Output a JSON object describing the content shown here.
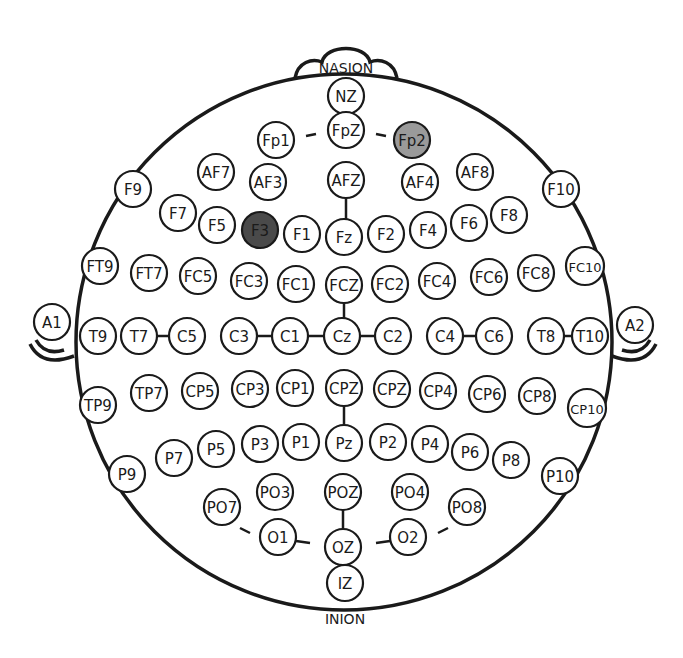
{
  "diagram": {
    "landmarks": {
      "top": "NASION",
      "bottom": "INION"
    },
    "colors": {
      "highlight_dark": "#4a4a4a",
      "highlight_light": "#9a9a9a",
      "stroke": "#1a1a1a",
      "fill": "#ffffff"
    },
    "electrodes": [
      {
        "id": "NZ",
        "x": 346,
        "y": 96,
        "fill": "#ffffff"
      },
      {
        "id": "FpZ",
        "x": 346,
        "y": 130,
        "fill": "#ffffff"
      },
      {
        "id": "Fp1",
        "x": 276,
        "y": 140,
        "fill": "#ffffff"
      },
      {
        "id": "Fp2",
        "x": 412,
        "y": 140,
        "fill": "#9a9a9a"
      },
      {
        "id": "AF7",
        "x": 216,
        "y": 172,
        "fill": "#ffffff"
      },
      {
        "id": "AF3",
        "x": 268,
        "y": 182,
        "fill": "#ffffff"
      },
      {
        "id": "AFZ",
        "x": 346,
        "y": 180,
        "fill": "#ffffff"
      },
      {
        "id": "AF4",
        "x": 420,
        "y": 182,
        "fill": "#ffffff"
      },
      {
        "id": "AF8",
        "x": 475,
        "y": 172,
        "fill": "#ffffff"
      },
      {
        "id": "F9",
        "x": 133,
        "y": 189,
        "fill": "#ffffff"
      },
      {
        "id": "F10",
        "x": 561,
        "y": 189,
        "fill": "#ffffff"
      },
      {
        "id": "F7",
        "x": 178,
        "y": 213,
        "fill": "#ffffff"
      },
      {
        "id": "F5",
        "x": 217,
        "y": 225,
        "fill": "#ffffff"
      },
      {
        "id": "F3",
        "x": 260,
        "y": 230,
        "fill": "#4a4a4a"
      },
      {
        "id": "F1",
        "x": 302,
        "y": 234,
        "fill": "#ffffff"
      },
      {
        "id": "Fz",
        "x": 344,
        "y": 237,
        "fill": "#ffffff"
      },
      {
        "id": "F2",
        "x": 386,
        "y": 234,
        "fill": "#ffffff"
      },
      {
        "id": "F4",
        "x": 428,
        "y": 230,
        "fill": "#ffffff"
      },
      {
        "id": "F6",
        "x": 469,
        "y": 223,
        "fill": "#ffffff"
      },
      {
        "id": "F8",
        "x": 509,
        "y": 215,
        "fill": "#ffffff"
      },
      {
        "id": "FT9",
        "x": 100,
        "y": 266,
        "fill": "#ffffff"
      },
      {
        "id": "FT7",
        "x": 149,
        "y": 273,
        "fill": "#ffffff"
      },
      {
        "id": "FC5",
        "x": 198,
        "y": 276,
        "fill": "#ffffff"
      },
      {
        "id": "FC3",
        "x": 249,
        "y": 281,
        "fill": "#ffffff"
      },
      {
        "id": "FC1",
        "x": 296,
        "y": 284,
        "fill": "#ffffff"
      },
      {
        "id": "FCZ",
        "x": 344,
        "y": 285,
        "fill": "#ffffff"
      },
      {
        "id": "FC2",
        "x": 390,
        "y": 284,
        "fill": "#ffffff"
      },
      {
        "id": "FC4",
        "x": 437,
        "y": 281,
        "fill": "#ffffff"
      },
      {
        "id": "FC6",
        "x": 489,
        "y": 277,
        "fill": "#ffffff"
      },
      {
        "id": "FC8",
        "x": 536,
        "y": 273,
        "fill": "#ffffff"
      },
      {
        "id": "FC10",
        "x": 585,
        "y": 266,
        "fill": "#ffffff"
      },
      {
        "id": "A1",
        "x": 52,
        "y": 322,
        "fill": "#ffffff"
      },
      {
        "id": "T9",
        "x": 98,
        "y": 336,
        "fill": "#ffffff"
      },
      {
        "id": "T7",
        "x": 139,
        "y": 336,
        "fill": "#ffffff"
      },
      {
        "id": "C5",
        "x": 187,
        "y": 336,
        "fill": "#ffffff"
      },
      {
        "id": "C3",
        "x": 239,
        "y": 336,
        "fill": "#ffffff"
      },
      {
        "id": "C1",
        "x": 290,
        "y": 336,
        "fill": "#ffffff"
      },
      {
        "id": "Cz",
        "x": 342,
        "y": 336,
        "fill": "#ffffff"
      },
      {
        "id": "C2",
        "x": 393,
        "y": 336,
        "fill": "#ffffff"
      },
      {
        "id": "C4",
        "x": 445,
        "y": 336,
        "fill": "#ffffff"
      },
      {
        "id": "C6",
        "x": 494,
        "y": 336,
        "fill": "#ffffff"
      },
      {
        "id": "T8",
        "x": 546,
        "y": 336,
        "fill": "#ffffff"
      },
      {
        "id": "T10",
        "x": 590,
        "y": 336,
        "fill": "#ffffff"
      },
      {
        "id": "A2",
        "x": 635,
        "y": 325,
        "fill": "#ffffff"
      },
      {
        "id": "TP9",
        "x": 98,
        "y": 405,
        "fill": "#ffffff"
      },
      {
        "id": "TP7",
        "x": 149,
        "y": 393,
        "fill": "#ffffff"
      },
      {
        "id": "CP5",
        "x": 200,
        "y": 391,
        "fill": "#ffffff"
      },
      {
        "id": "CP3",
        "x": 250,
        "y": 389,
        "fill": "#ffffff"
      },
      {
        "id": "CP1",
        "x": 295,
        "y": 388,
        "fill": "#ffffff"
      },
      {
        "id": "CPZ",
        "x": 344,
        "y": 388,
        "fill": "#ffffff"
      },
      {
        "id": "CPZ",
        "x": 392,
        "y": 389,
        "fill": "#ffffff"
      },
      {
        "id": "CP4",
        "x": 438,
        "y": 391,
        "fill": "#ffffff"
      },
      {
        "id": "CP6",
        "x": 487,
        "y": 394,
        "fill": "#ffffff"
      },
      {
        "id": "CP8",
        "x": 537,
        "y": 396,
        "fill": "#ffffff"
      },
      {
        "id": "CP10",
        "x": 587,
        "y": 408,
        "fill": "#ffffff"
      },
      {
        "id": "P9",
        "x": 127,
        "y": 474,
        "fill": "#ffffff"
      },
      {
        "id": "P7",
        "x": 174,
        "y": 458,
        "fill": "#ffffff"
      },
      {
        "id": "P5",
        "x": 216,
        "y": 449,
        "fill": "#ffffff"
      },
      {
        "id": "P3",
        "x": 260,
        "y": 444,
        "fill": "#ffffff"
      },
      {
        "id": "P1",
        "x": 301,
        "y": 442,
        "fill": "#ffffff"
      },
      {
        "id": "Pz",
        "x": 344,
        "y": 443,
        "fill": "#ffffff"
      },
      {
        "id": "P2",
        "x": 388,
        "y": 442,
        "fill": "#ffffff"
      },
      {
        "id": "P4",
        "x": 430,
        "y": 444,
        "fill": "#ffffff"
      },
      {
        "id": "P6",
        "x": 470,
        "y": 452,
        "fill": "#ffffff"
      },
      {
        "id": "P8",
        "x": 511,
        "y": 460,
        "fill": "#ffffff"
      },
      {
        "id": "P10",
        "x": 560,
        "y": 476,
        "fill": "#ffffff"
      },
      {
        "id": "PO7",
        "x": 222,
        "y": 507,
        "fill": "#ffffff"
      },
      {
        "id": "PO3",
        "x": 275,
        "y": 492,
        "fill": "#ffffff"
      },
      {
        "id": "POZ",
        "x": 343,
        "y": 492,
        "fill": "#ffffff"
      },
      {
        "id": "PO4",
        "x": 410,
        "y": 492,
        "fill": "#ffffff"
      },
      {
        "id": "PO8",
        "x": 467,
        "y": 507,
        "fill": "#ffffff"
      },
      {
        "id": "O1",
        "x": 278,
        "y": 537,
        "fill": "#ffffff"
      },
      {
        "id": "OZ",
        "x": 343,
        "y": 547,
        "fill": "#ffffff"
      },
      {
        "id": "O2",
        "x": 408,
        "y": 537,
        "fill": "#ffffff"
      },
      {
        "id": "IZ",
        "x": 345,
        "y": 583,
        "fill": "#ffffff"
      }
    ]
  }
}
